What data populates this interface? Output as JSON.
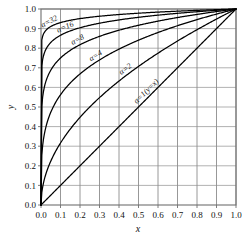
{
  "chart_data": {
    "type": "line",
    "title": "",
    "subtitle": "",
    "xlabel": "x",
    "ylabel": "y",
    "xlim": [
      0.0,
      1.0
    ],
    "ylim": [
      0.0,
      1.0
    ],
    "grid": true,
    "legend_position": "inline-curve-labels",
    "formula": "y = x^(1/a)",
    "x_ticks": [
      "0.0",
      "0.1",
      "0.2",
      "0.3",
      "0.4",
      "0.5",
      "0.6",
      "0.7",
      "0.8",
      "0.9",
      "1.0"
    ],
    "y_ticks": [
      "0.0",
      "0.1",
      "0.2",
      "0.3",
      "0.4",
      "0.5",
      "0.6",
      "0.7",
      "0.8",
      "0.9",
      "1.0"
    ],
    "x": [
      0.0,
      0.02,
      0.05,
      0.1,
      0.15,
      0.2,
      0.25,
      0.3,
      0.35,
      0.4,
      0.45,
      0.5,
      0.55,
      0.6,
      0.65,
      0.7,
      0.75,
      0.8,
      0.85,
      0.9,
      0.95,
      1.0
    ],
    "series": [
      {
        "name": "a=1(y=x)",
        "alpha": 1,
        "label": "α=1(y=x)",
        "label_x": 0.56,
        "label_y": 0.56,
        "values": [
          0.0,
          0.02,
          0.05,
          0.1,
          0.15,
          0.2,
          0.25,
          0.3,
          0.35,
          0.4,
          0.45,
          0.5,
          0.55,
          0.6,
          0.65,
          0.7,
          0.75,
          0.8,
          0.85,
          0.9,
          0.95,
          1.0
        ]
      },
      {
        "name": "a=2",
        "alpha": 2,
        "label": "α=2",
        "label_x": 0.45,
        "label_y": 0.671,
        "values": [
          0.0,
          0.141,
          0.224,
          0.316,
          0.387,
          0.447,
          0.5,
          0.548,
          0.592,
          0.632,
          0.671,
          0.707,
          0.742,
          0.775,
          0.806,
          0.837,
          0.866,
          0.894,
          0.922,
          0.949,
          0.975,
          1.0
        ]
      },
      {
        "name": "a=4",
        "alpha": 4,
        "label": "α=4",
        "label_x": 0.295,
        "label_y": 0.737,
        "values": [
          0.0,
          0.376,
          0.473,
          0.562,
          0.622,
          0.669,
          0.707,
          0.74,
          0.769,
          0.795,
          0.819,
          0.841,
          0.861,
          0.88,
          0.898,
          0.915,
          0.931,
          0.946,
          0.96,
          0.974,
          0.987,
          1.0
        ]
      },
      {
        "name": "a=8",
        "alpha": 8,
        "label": "α=8",
        "label_x": 0.2,
        "label_y": 0.818,
        "values": [
          0.0,
          0.613,
          0.688,
          0.75,
          0.789,
          0.818,
          0.841,
          0.86,
          0.877,
          0.891,
          0.905,
          0.917,
          0.928,
          0.938,
          0.948,
          0.957,
          0.965,
          0.973,
          0.98,
          0.987,
          0.994,
          1.0
        ]
      },
      {
        "name": "a=16",
        "alpha": 16,
        "label": "α=16",
        "label_x": 0.135,
        "label_y": 0.881,
        "values": [
          0.0,
          0.783,
          0.83,
          0.866,
          0.888,
          0.905,
          0.917,
          0.927,
          0.936,
          0.944,
          0.951,
          0.958,
          0.963,
          0.968,
          0.973,
          0.978,
          0.982,
          0.986,
          0.99,
          0.994,
          0.997,
          1.0
        ]
      },
      {
        "name": "a=32",
        "alpha": 32,
        "label": "α=32",
        "label_x": 0.055,
        "label_y": 0.911,
        "values": [
          0.0,
          0.885,
          0.911,
          0.931,
          0.943,
          0.951,
          0.958,
          0.963,
          0.967,
          0.971,
          0.975,
          0.979,
          0.982,
          0.984,
          0.986,
          0.989,
          0.991,
          0.993,
          0.995,
          0.997,
          0.998,
          1.0
        ]
      }
    ],
    "colors": {
      "curve": "#000000",
      "grid_vertical": "#8c8c8c",
      "grid_horizontal": "#a8a8a8",
      "axis": "#6f6f6f",
      "text": "#111111",
      "background": "#ffffff"
    }
  }
}
